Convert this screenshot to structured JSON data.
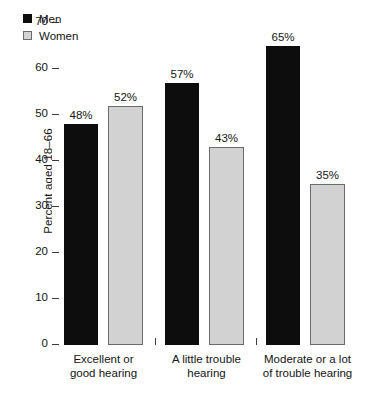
{
  "chart_data": {
    "type": "bar",
    "title": "",
    "subtitle": "",
    "xlabel": "",
    "ylabel": "Percent aged 18–66",
    "ylim": [
      0,
      70
    ],
    "ytick_values": [
      0,
      10,
      20,
      30,
      40,
      50,
      60,
      70
    ],
    "ytick_labels": [
      "0",
      "10",
      "20",
      "30",
      "40",
      "50",
      "60",
      "70"
    ],
    "grid": false,
    "legend_position": "top-left",
    "categories": [
      "Excellent or good hearing",
      "A little trouble hearing",
      "Moderate or a lot of trouble hearing"
    ],
    "category_lines": [
      [
        "Excellent or",
        "good hearing"
      ],
      [
        "A little trouble",
        "hearing"
      ],
      [
        "Moderate or a lot",
        "of trouble hearing"
      ]
    ],
    "series": [
      {
        "name": "Men",
        "color": "#0d0d0d",
        "values": [
          48,
          57,
          65
        ],
        "labels": [
          "48%",
          "57%",
          "65%"
        ]
      },
      {
        "name": "Women",
        "color": "#d2d2d2",
        "values": [
          52,
          43,
          35
        ],
        "labels": [
          "52%",
          "43%",
          "35%"
        ]
      }
    ]
  },
  "legend": {
    "items": [
      {
        "label": "Men",
        "swatch": "men"
      },
      {
        "label": "Women",
        "swatch": "women"
      }
    ]
  },
  "axis": {
    "y_title": "Percent aged 18–66",
    "ticks": [
      {
        "value": 70,
        "label": "70"
      },
      {
        "value": 60,
        "label": "60"
      },
      {
        "value": 50,
        "label": "50"
      },
      {
        "value": 40,
        "label": "40"
      },
      {
        "value": 30,
        "label": "30"
      },
      {
        "value": 20,
        "label": "20"
      },
      {
        "value": 10,
        "label": "10"
      },
      {
        "value": 0,
        "label": "0"
      }
    ]
  },
  "bars": [
    {
      "group": 0,
      "series": "Men",
      "value": 48,
      "label": "48%",
      "x": 12,
      "w": 34
    },
    {
      "group": 0,
      "series": "Women",
      "value": 52,
      "label": "52%",
      "x": 56,
      "w": 35
    },
    {
      "group": 1,
      "series": "Men",
      "value": 57,
      "label": "57%",
      "x": 113,
      "w": 34
    },
    {
      "group": 1,
      "series": "Women",
      "value": 43,
      "label": "43%",
      "x": 157,
      "w": 35
    },
    {
      "group": 2,
      "series": "Men",
      "value": 65,
      "label": "65%",
      "x": 214,
      "w": 34
    },
    {
      "group": 2,
      "series": "Women",
      "value": 35,
      "label": "35%",
      "x": 258,
      "w": 35
    }
  ],
  "group_separators": [
    103,
    204
  ],
  "category_positions": [
    52,
    155,
    256
  ]
}
